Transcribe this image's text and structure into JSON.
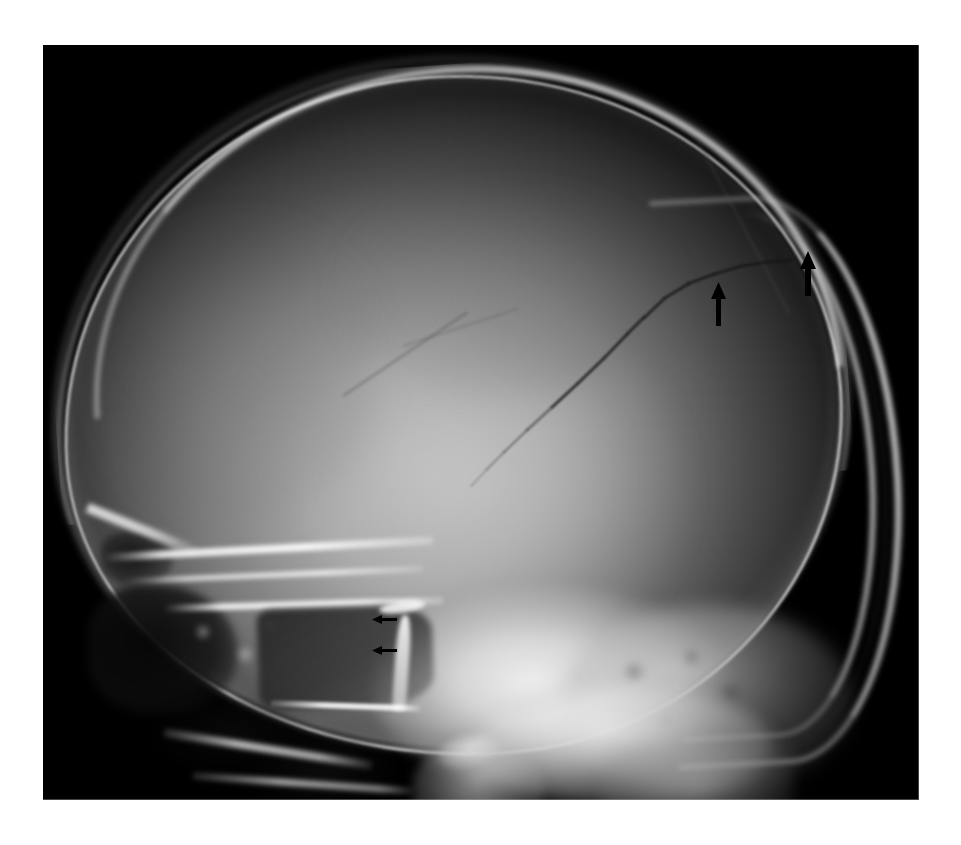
{
  "page": {
    "background_color": "#ffffff",
    "width": 961,
    "height": 845,
    "caption": ""
  },
  "radiograph": {
    "name": "lateral-skull-radiograph",
    "modality": "X-ray",
    "projection": "lateral",
    "region": "skull",
    "panel": {
      "x": 43,
      "y": 45,
      "width": 876,
      "height": 755
    },
    "background_color": "#000000",
    "tone_colors": {
      "film_background": "#000000",
      "scalp_soft_tissue": "#8c8c8c",
      "calvarium_cortex": "#eeeeee",
      "brain_parenchyma_light": "#b4b4b4",
      "brain_parenchyma_dark": "#3a3a3a",
      "skull_base_bright": "#f2f2f2",
      "sinus_air_dark": "#161616",
      "fracture_lucency": "#161616",
      "annotation_arrow": "#000000"
    }
  },
  "findings": {
    "fracture_line_label": "linear skull fracture",
    "fracture_description": "dark linear lucency coursing from the posterior parietal convexity inferiorly and anteriorly",
    "sella_label": "sella turcica / sphenoid sinus"
  },
  "annotations": {
    "large_arrows": [
      {
        "name": "fracture-arrow-anterior",
        "direction": "up",
        "x": 718,
        "y": 282,
        "length": 44,
        "head_width": 15,
        "head_height": 17,
        "shaft_width": 5,
        "color": "#000000"
      },
      {
        "name": "fracture-arrow-posterior",
        "direction": "up",
        "x": 808,
        "y": 251,
        "length": 45,
        "head_width": 16,
        "head_height": 18,
        "shaft_width": 6,
        "color": "#000000"
      }
    ],
    "small_arrows": [
      {
        "name": "sella-arrow-upper",
        "direction": "left",
        "x": 372,
        "y": 614,
        "length": 25,
        "head_width": 9,
        "head_height": 10,
        "shaft_width": 3,
        "color": "#000000"
      },
      {
        "name": "sella-arrow-lower",
        "direction": "left",
        "x": 372,
        "y": 645,
        "length": 25,
        "head_width": 9,
        "head_height": 10,
        "shaft_width": 3,
        "color": "#000000"
      }
    ]
  },
  "anatomy_labels": {
    "calvarium": "calvarium",
    "frontal_bone": "frontal bone",
    "occipital_bone": "occipital bone",
    "petrous_ridge": "petrous temporal bone",
    "mastoid_air_cells": "mastoid air cells",
    "sphenoid_sinus": "sphenoid sinus",
    "sella_turcica": "sella turcica",
    "orbital_roof": "orbital roof",
    "frontal_sinus": "frontal sinus",
    "zygomatic_arch": "zygomatic arch",
    "hard_palate": "hard palate",
    "mandibular_condyle": "mandibular condyle",
    "cervical_spine": "cervical spine",
    "nasal_bridge": "nasal bridge"
  }
}
